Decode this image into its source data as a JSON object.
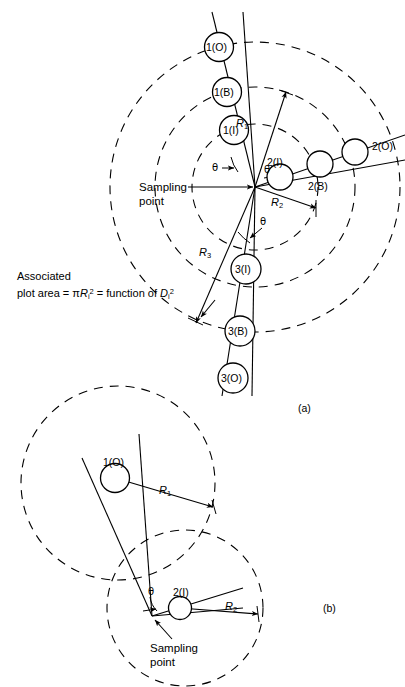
{
  "figure": {
    "panels": [
      {
        "id": "a",
        "label": "(a)",
        "sampling_point_label": "Sampling\npoint",
        "sampling_point_line1": "Sampling",
        "sampling_point_line2": "point",
        "radius_labels": [
          "R1",
          "R2",
          "R3"
        ],
        "angle_label": "θ",
        "angle_count": 3,
        "tree_groups": [
          {
            "group": "1",
            "circles": [
              {
                "label": "1(O)",
                "kind": "outside"
              },
              {
                "label": "1(B)",
                "kind": "borderline"
              },
              {
                "label": "1(I)",
                "kind": "inside"
              }
            ]
          },
          {
            "group": "2",
            "circles": [
              {
                "label": "2(I)",
                "kind": "inside"
              },
              {
                "label": "2(B)",
                "kind": "borderline"
              },
              {
                "label": "2(O)",
                "kind": "outside"
              }
            ]
          },
          {
            "group": "3",
            "circles": [
              {
                "label": "3(I)",
                "kind": "inside"
              },
              {
                "label": "3(B)",
                "kind": "borderline"
              },
              {
                "label": "3(O)",
                "kind": "outside"
              }
            ]
          }
        ]
      },
      {
        "id": "b",
        "label": "(b)",
        "sampling_point_line1": "Sampling",
        "sampling_point_line2": "point",
        "radius_labels": [
          "R1",
          "R2"
        ],
        "angle_label": "θ",
        "circles": [
          {
            "label": "1(O)",
            "kind": "outside"
          },
          {
            "label": "2(I)",
            "kind": "inside"
          }
        ]
      }
    ],
    "annotation": {
      "line1": "Associated",
      "line2_prefix": "plot area = π",
      "line2_var": "R",
      "line2_var_sub": "i",
      "line2_var_sup": "2",
      "line2_mid": " = function of ",
      "line2_var2": "D",
      "line2_var2_sub": "i",
      "line2_var2_sup": "2"
    },
    "colors": {
      "ink": "#000000",
      "background": "#ffffff"
    }
  }
}
